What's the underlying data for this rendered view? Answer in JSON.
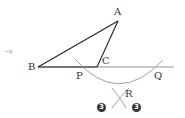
{
  "diagram": {
    "arrow_icon": "right-arrow-icon",
    "points": {
      "A": {
        "label": "A"
      },
      "B": {
        "label": "B"
      },
      "C": {
        "label": "C"
      },
      "P": {
        "label": "P"
      },
      "Q": {
        "label": "Q"
      },
      "R": {
        "label": "R"
      }
    },
    "step_badges": [
      "3",
      "3"
    ],
    "colors": {
      "triangle_stroke": "#222222",
      "construction_stroke": "#888888",
      "arrow": "#c8c8c8",
      "badge_bg": "#333333"
    }
  }
}
